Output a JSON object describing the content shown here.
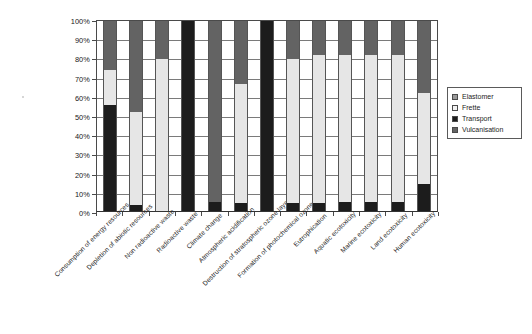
{
  "chart_data": {
    "type": "bar",
    "subtype": "stacked-percentage-column",
    "title": "",
    "xlabel": "",
    "ylabel": "",
    "ylim": [
      0,
      100
    ],
    "yunit": "%",
    "grid": true,
    "legend_position": "right",
    "ytick_labels": [
      "0%",
      "10%",
      "20%",
      "30%",
      "40%",
      "50%",
      "60%",
      "70%",
      "80%",
      "90%",
      "100%"
    ],
    "ytick_values": [
      0,
      10,
      20,
      30,
      40,
      50,
      60,
      70,
      80,
      90,
      100
    ],
    "categories": [
      "Consumption of energy resources",
      "Depletion of abiotic resources",
      "Non radioactive waste",
      "Radioactive waste",
      "Climate change",
      "Atmospheric acidification",
      "Destruction of stratospheric ozone layer",
      "Formation of photochemical ozone",
      "Eutrophication",
      "Aquatic ecotoxicity",
      "Marine ecotoxicity",
      "Land ecotoxicity",
      "Human ecotoxicity"
    ],
    "series": [
      {
        "name": "Vulcanisation",
        "color": "#636363",
        "values": [
          26,
          48,
          20,
          0,
          95,
          33,
          0,
          20,
          18,
          18,
          18,
          18,
          38
        ]
      },
      {
        "name": "Frette",
        "color": "#e3e3e3",
        "values": [
          18,
          49,
          80,
          0,
          0,
          63,
          0,
          76,
          78,
          77,
          77,
          77,
          48
        ]
      },
      {
        "name": "Transport",
        "color": "#1c1c1c",
        "values": [
          56,
          3,
          0,
          100,
          5,
          4,
          100,
          4,
          4,
          5,
          5,
          5,
          14
        ]
      },
      {
        "name": "Elastomer",
        "color": "#9a9a9a",
        "values": [
          0,
          0,
          0,
          0,
          0,
          0,
          0,
          0,
          0,
          0,
          0,
          0,
          0
        ]
      }
    ],
    "stack_order_bottom_to_top": [
      "Transport",
      "Frette",
      "Vulcanisation"
    ],
    "bars": [
      {
        "category": "Consumption of energy resources",
        "segments": [
          {
            "series": "Transport",
            "value": 56
          },
          {
            "series": "Frette",
            "value": 18
          },
          {
            "series": "Vulcanisation",
            "value": 26
          }
        ]
      },
      {
        "category": "Depletion of abiotic resources",
        "segments": [
          {
            "series": "Transport",
            "value": 3
          },
          {
            "series": "Frette",
            "value": 49
          },
          {
            "series": "Vulcanisation",
            "value": 48
          }
        ]
      },
      {
        "category": "Non radioactive waste",
        "segments": [
          {
            "series": "Transport",
            "value": 0
          },
          {
            "series": "Frette",
            "value": 80
          },
          {
            "series": "Vulcanisation",
            "value": 20
          }
        ]
      },
      {
        "category": "Radioactive waste",
        "segments": [
          {
            "series": "Transport",
            "value": 100
          },
          {
            "series": "Frette",
            "value": 0
          },
          {
            "series": "Vulcanisation",
            "value": 0
          }
        ]
      },
      {
        "category": "Climate change",
        "segments": [
          {
            "series": "Transport",
            "value": 5
          },
          {
            "series": "Frette",
            "value": 0
          },
          {
            "series": "Vulcanisation",
            "value": 95
          }
        ]
      },
      {
        "category": "Atmospheric acidification",
        "segments": [
          {
            "series": "Transport",
            "value": 4
          },
          {
            "series": "Frette",
            "value": 63
          },
          {
            "series": "Vulcanisation",
            "value": 33
          }
        ]
      },
      {
        "category": "Destruction of stratospheric ozone layer",
        "segments": [
          {
            "series": "Transport",
            "value": 100
          },
          {
            "series": "Frette",
            "value": 0
          },
          {
            "series": "Vulcanisation",
            "value": 0
          }
        ]
      },
      {
        "category": "Formation of photochemical ozone",
        "segments": [
          {
            "series": "Transport",
            "value": 4
          },
          {
            "series": "Frette",
            "value": 76
          },
          {
            "series": "Vulcanisation",
            "value": 20
          }
        ]
      },
      {
        "category": "Eutrophication",
        "segments": [
          {
            "series": "Transport",
            "value": 4
          },
          {
            "series": "Frette",
            "value": 78
          },
          {
            "series": "Vulcanisation",
            "value": 18
          }
        ]
      },
      {
        "category": "Aquatic ecotoxicity",
        "segments": [
          {
            "series": "Transport",
            "value": 5
          },
          {
            "series": "Frette",
            "value": 77
          },
          {
            "series": "Vulcanisation",
            "value": 18
          }
        ]
      },
      {
        "category": "Marine ecotoxicity",
        "segments": [
          {
            "series": "Transport",
            "value": 5
          },
          {
            "series": "Frette",
            "value": 77
          },
          {
            "series": "Vulcanisation",
            "value": 18
          }
        ]
      },
      {
        "category": "Land ecotoxicity",
        "segments": [
          {
            "series": "Transport",
            "value": 5
          },
          {
            "series": "Frette",
            "value": 77
          },
          {
            "series": "Vulcanisation",
            "value": 18
          }
        ]
      },
      {
        "category": "Human ecotoxicity",
        "segments": [
          {
            "series": "Transport",
            "value": 14
          },
          {
            "series": "Frette",
            "value": 48
          },
          {
            "series": "Vulcanisation",
            "value": 38
          }
        ]
      }
    ]
  },
  "legend": {
    "items": [
      {
        "label": "Elastomer",
        "color": "#9a9a9a"
      },
      {
        "label": "Frette",
        "color": "#f2f2f2"
      },
      {
        "label": "Transport",
        "color": "#1c1c1c"
      },
      {
        "label": "Vulcanisation",
        "color": "#636363"
      }
    ]
  },
  "colors": {
    "axis": "#4a4a4a",
    "grid": "#7a7a7a",
    "text": "#1c1c1c",
    "background": "#ffffff"
  }
}
